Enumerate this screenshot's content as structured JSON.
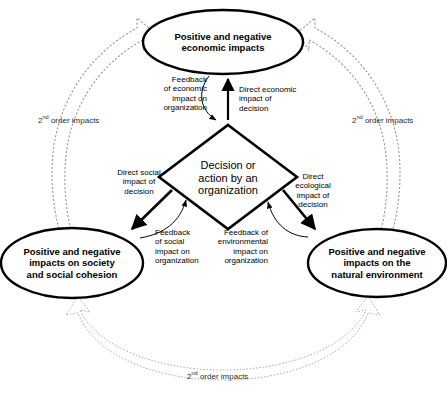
{
  "diagram": {
    "nodes": {
      "economic": {
        "label": "Positive and negative economic impacts",
        "lines": [
          "Positive and negative",
          "economic impacts"
        ],
        "shape": "ellipse"
      },
      "society": {
        "label": "Positive and negative impacts on society and social cohesion",
        "lines": [
          "Positive and negative",
          "impacts on society",
          "and social cohesion"
        ],
        "shape": "ellipse"
      },
      "environment": {
        "label": "Positive and negative impacts on the natural environment",
        "lines": [
          "Positive and negative",
          "impacts on the",
          "natural environment"
        ],
        "shape": "ellipse"
      },
      "decision": {
        "label": "Decision or action by an organization",
        "lines": [
          "Decision or",
          "action by an",
          "organization"
        ],
        "shape": "diamond"
      }
    },
    "edge_labels": {
      "feedback_economic": {
        "label": "Feedback of economic impact on organization",
        "lines": [
          "Feedback",
          "of economic",
          "impact on",
          "organization"
        ],
        "align": "right"
      },
      "direct_economic": {
        "label": "Direct economic impact of decision",
        "lines": [
          "Direct economic",
          "impact of",
          "decision"
        ],
        "align": "left"
      },
      "direct_social": {
        "label": "Direct social impact of decision",
        "lines": [
          "Direct social",
          "impact of",
          "decision"
        ],
        "align": "center"
      },
      "feedback_social": {
        "label": "Feedback of social impact on organization",
        "lines": [
          "Feedback",
          "of social",
          "impact on",
          "organization"
        ],
        "align": "left"
      },
      "feedback_environmental": {
        "label": "Feedback of environmental impact on organization",
        "lines": [
          "Feedback of",
          "environmental",
          "impact on",
          "organization"
        ],
        "align": "right"
      },
      "direct_ecological": {
        "label": "Direct ecological impact of decision",
        "lines": [
          "Direct",
          "ecological",
          "impact of",
          "decision"
        ],
        "align": "center"
      }
    },
    "second_order": {
      "prefix": "2",
      "ordinal": "nd",
      "suffix": " order impacts",
      "left": "2nd order impacts",
      "right": "2nd order impacts",
      "bottom": "2nd order impacts"
    },
    "colors": {
      "stroke": "#000000",
      "node_fill": "#ffffff",
      "background": "#ffffff",
      "block_arrow_stroke": "#8c8c8c",
      "dotted_arc_stroke": "#9a9a9a"
    }
  }
}
